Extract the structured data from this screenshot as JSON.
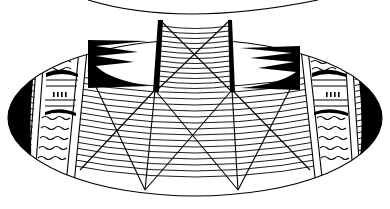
{
  "figure": {
    "style": "black ink on white",
    "colors": {
      "ink": "#000000",
      "background": "#ffffff"
    },
    "elements": {
      "neck": "hatched neck band with large X",
      "body": "elliptical body with curved horizontal hatching and crossing diagonal lines",
      "left_panel": "vertical panel with wavy stripes and dashes",
      "right_panel": "vertical panel with wavy stripes and dashes",
      "flame_motifs": "black comb/flame motifs flanking the neck",
      "end_caps": "solid black crescent ends"
    }
  }
}
